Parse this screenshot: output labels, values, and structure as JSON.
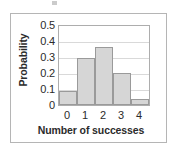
{
  "figure": {
    "frame_color": "#b5b5b5",
    "background": "#ffffff"
  },
  "chart_data": {
    "type": "bar",
    "title": "",
    "subtitle": "",
    "xlabel": "Number of successes",
    "ylabel": "Probability",
    "categories": [
      "0",
      "1",
      "2",
      "3",
      "4"
    ],
    "values": [
      0.09,
      0.3,
      0.37,
      0.2,
      0.04
    ],
    "series": [
      {
        "name": "Probability",
        "values": [
          0.09,
          0.3,
          0.37,
          0.2,
          0.04
        ]
      }
    ],
    "xlim": [
      -0.5,
      4.5
    ],
    "ylim": [
      0,
      0.5
    ],
    "ytick_labels": [
      "0.5",
      "0.4",
      "0.3",
      "0.2",
      "0.1",
      "0"
    ],
    "ytick_values": [
      0.5,
      0.4,
      0.3,
      0.2,
      0.1,
      0
    ],
    "xtick_labels": [
      "0",
      "1",
      "2",
      "3",
      "4"
    ],
    "xtick_values": [
      0,
      1,
      2,
      3,
      4
    ],
    "grid": "horizontal",
    "legend": "none",
    "bar_fill_color": "#d6d6d6",
    "bar_edge_color": "#9a9a9a",
    "gridline_color": "#d9d9d9",
    "axis_color": "#adadad",
    "annotations": []
  }
}
